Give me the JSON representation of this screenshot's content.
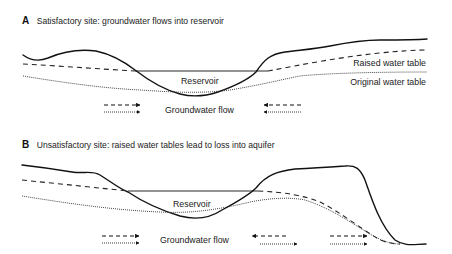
{
  "panels": [
    {
      "letter": "A",
      "title": "Satisfactory site: groundwater flows into reservoir",
      "reservoir_label": "Reservoir",
      "raised_label": "Raised water table",
      "original_label": "Original water table",
      "flow_label": "Groundwater flow",
      "flow_arrows": [
        {
          "group": "left",
          "dashed": "right",
          "dotted": "right"
        },
        {
          "group": "right",
          "dashed": "left",
          "dotted": "left"
        }
      ]
    },
    {
      "letter": "B",
      "title": "Unsatisfactory site: raised water tables lead to loss into aquifer",
      "reservoir_label": "Reservoir",
      "flow_label": "Groundwater flow",
      "flow_arrows": [
        {
          "group": "left",
          "dashed": "right",
          "dotted": "right"
        },
        {
          "group": "middle",
          "dashed": "left",
          "dotted": "right"
        },
        {
          "group": "right",
          "dashed": "right",
          "dotted": "right"
        }
      ]
    }
  ],
  "legend": {
    "ground_surface": "solid line",
    "raised_water_table": "dashed line",
    "original_water_table": "dotted line"
  }
}
